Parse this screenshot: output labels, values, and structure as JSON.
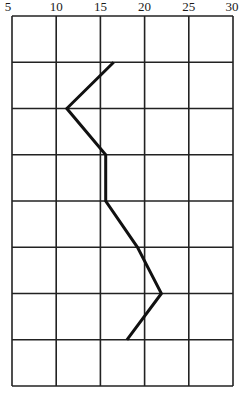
{
  "chart_data": {
    "type": "line",
    "title": "",
    "xlabel": "",
    "ylabel": "",
    "x_ticks": [
      "5",
      "10",
      "15",
      "20",
      "25",
      "30"
    ],
    "xlim": [
      5,
      30
    ],
    "x_axis_position": "top",
    "rows": 8,
    "grid": true,
    "legend": null,
    "orientation": "vertical profile (x value per horizontal grid level, top to bottom)",
    "series": [
      {
        "name": "profile",
        "color": "#111111",
        "points": [
          {
            "level": 1,
            "x": 16.5
          },
          {
            "level": 2,
            "x": 11.2
          },
          {
            "level": 3,
            "x": 15.6
          },
          {
            "level": 4,
            "x": 15.6
          },
          {
            "level": 5,
            "x": 19.2
          },
          {
            "level": 6,
            "x": 21.9
          },
          {
            "level": 7,
            "x": 18.0
          }
        ]
      }
    ]
  },
  "colors": {
    "grid": "#222222",
    "line": "#111111",
    "background": "#ffffff"
  }
}
